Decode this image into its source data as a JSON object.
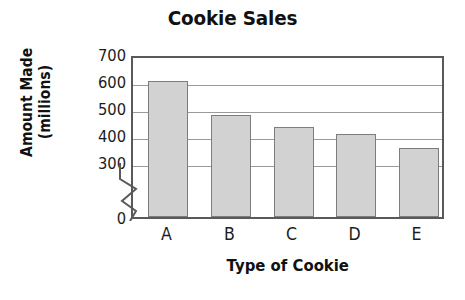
{
  "chart_data": {
    "type": "bar",
    "title": "Cookie Sales",
    "xlabel": "Type of Cookie",
    "ylabel_line1": "Amount Made",
    "ylabel_line2": "(millions)",
    "ylabel": "Amount Made (millions)",
    "categories": [
      "A",
      "B",
      "C",
      "D",
      "E"
    ],
    "values": [
      600,
      475,
      428,
      402,
      352
    ],
    "ytick_labels": [
      "700",
      "600",
      "500",
      "400",
      "300",
      "0"
    ],
    "ytick_values": [
      700,
      600,
      500,
      400,
      300,
      0
    ],
    "ylim": [
      300,
      700
    ],
    "axis_break": true,
    "axis_break_between": [
      0,
      300
    ],
    "grid": true,
    "grid_axis": "y",
    "legend": null,
    "bar_fill_color": "#d2d2d2",
    "bar_border_color": "#7d7d7d",
    "axis_color": "#595959",
    "gridline_color": "#9a9a9a",
    "background_color": "#ffffff",
    "text_color": "#111111"
  }
}
